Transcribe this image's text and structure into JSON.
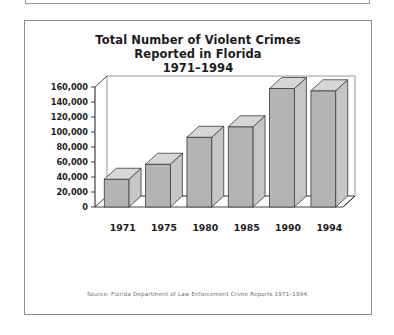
{
  "figure": {
    "source_note": "Source: Florida Department of Law Enforcement Crime Reports 1971–1994.",
    "title_lines": [
      "Total Number of Violent Crimes",
      "Reported in Florida",
      "1971–1994"
    ]
  },
  "colors": {
    "bar_front": "#b4b4b4",
    "bar_top": "#d6d6d6",
    "bar_side": "#c6c6c6",
    "bar_outline": "#3a3a3a",
    "axis": "#2e2e2e",
    "frame": "#8d8d8d",
    "floor": "#ffffff",
    "text": "#1b1b1b",
    "source_text": "#6e6e6e"
  },
  "chart_data": {
    "type": "bar",
    "title": "Total Number of Violent Crimes Reported in Florida 1971–1994",
    "xlabel": "",
    "ylabel": "",
    "categories": [
      "1971",
      "1975",
      "1980",
      "1985",
      "1990",
      "1994"
    ],
    "values": [
      37000,
      57000,
      93000,
      107000,
      158000,
      155000
    ],
    "ylim": [
      0,
      160000
    ],
    "ytick_values": [
      0,
      20000,
      40000,
      60000,
      80000,
      100000,
      120000,
      140000,
      160000
    ],
    "ytick_labels": [
      "0",
      "20,000",
      "40,000",
      "60,000",
      "80,000",
      "100,000",
      "120,000",
      "140,000",
      "160,000"
    ],
    "grid": false,
    "legend": null,
    "style": "3d-column",
    "annotations": [
      "Source: Florida Department of Law Enforcement Crime Reports 1971–1994."
    ]
  }
}
